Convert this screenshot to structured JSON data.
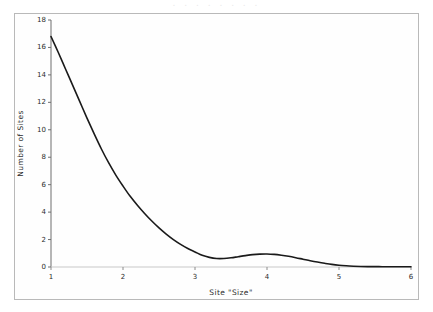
{
  "figure": {
    "top_cut_text": ". . .    . . .         . .",
    "background_color": "#fefefe",
    "frame_color": "#b9b9b9",
    "line_color": "#1a1a1a"
  },
  "chart_data": {
    "type": "line",
    "title": "",
    "xlabel": "Site \"Size\"",
    "ylabel": "Number of Sites",
    "xlim": [
      1,
      6
    ],
    "ylim": [
      0,
      18
    ],
    "xticks": [
      1,
      2,
      3,
      4,
      5,
      6
    ],
    "xtick_labels": [
      "1",
      "2",
      "3",
      "4",
      "5",
      "6"
    ],
    "yticks": [
      0,
      2,
      4,
      6,
      8,
      10,
      12,
      14,
      16,
      18
    ],
    "ytick_labels": [
      "0",
      "2",
      "4",
      "6",
      "8",
      "10",
      "12",
      "14",
      "16",
      "18"
    ],
    "grid": false,
    "legend": null,
    "series": [
      {
        "name": "Number of Sites",
        "color": "#1a1a1a",
        "linewidth": 1.6,
        "x": [
          1.0,
          1.1,
          1.2,
          1.3,
          1.4,
          1.5,
          1.6,
          1.7,
          1.8,
          1.9,
          2.0,
          2.1,
          2.2,
          2.3,
          2.4,
          2.5,
          2.6,
          2.7,
          2.8,
          2.9,
          3.0,
          3.1,
          3.2,
          3.3,
          3.4,
          3.5,
          3.6,
          3.7,
          3.8,
          3.9,
          4.0,
          4.1,
          4.2,
          4.3,
          4.4,
          4.5,
          4.6,
          4.7,
          4.8,
          4.9,
          5.0,
          5.1,
          5.2,
          5.3,
          5.4,
          5.5,
          5.6,
          5.7,
          5.8,
          5.9,
          6.0
        ],
        "y": [
          16.8,
          15.65,
          14.45,
          13.25,
          12.05,
          10.85,
          9.7,
          8.6,
          7.6,
          6.7,
          5.9,
          5.15,
          4.5,
          3.9,
          3.35,
          2.85,
          2.4,
          2.0,
          1.65,
          1.35,
          1.1,
          0.85,
          0.7,
          0.62,
          0.62,
          0.67,
          0.75,
          0.83,
          0.9,
          0.94,
          0.95,
          0.92,
          0.86,
          0.78,
          0.68,
          0.57,
          0.46,
          0.36,
          0.27,
          0.19,
          0.13,
          0.09,
          0.06,
          0.04,
          0.03,
          0.03,
          0.02,
          0.02,
          0.02,
          0.02,
          0.02
        ]
      }
    ]
  }
}
